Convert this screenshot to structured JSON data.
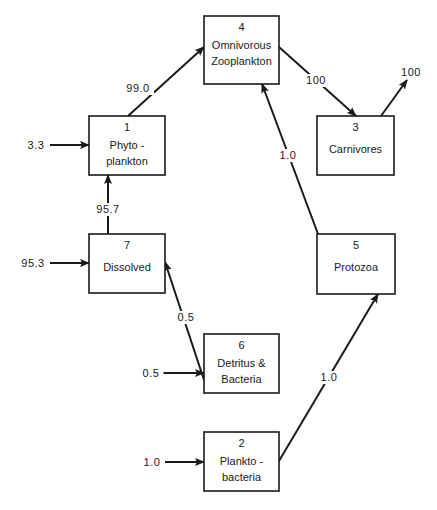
{
  "diagram": {
    "type": "compartment flow diagram",
    "nodes": [
      {
        "id": "4",
        "number": "4",
        "lines": [
          "Omnivorous",
          "Zooplankton"
        ],
        "x": 204,
        "y": 16,
        "w": 75,
        "h": 68
      },
      {
        "id": "1",
        "number": "1",
        "lines": [
          "Phyto  -",
          "plankton"
        ],
        "x": 89,
        "y": 116,
        "w": 76,
        "h": 59
      },
      {
        "id": "3",
        "number": "3",
        "lines": [
          "Carnivores"
        ],
        "x": 317,
        "y": 116,
        "w": 77,
        "h": 59
      },
      {
        "id": "7",
        "number": "7",
        "lines": [
          "Dissolved"
        ],
        "x": 89,
        "y": 234,
        "w": 76,
        "h": 59
      },
      {
        "id": "5",
        "number": "5",
        "lines": [
          "Protozoa"
        ],
        "x": 317,
        "y": 234,
        "w": 78,
        "h": 60
      },
      {
        "id": "6",
        "number": "6",
        "lines": [
          "Detritus  &",
          "Bacteria"
        ],
        "x": 204,
        "y": 334,
        "w": 75,
        "h": 59
      },
      {
        "id": "2",
        "number": "2",
        "lines": [
          "Plankto  -",
          "bacteria"
        ],
        "x": 204,
        "y": 432,
        "w": 75,
        "h": 59
      }
    ],
    "flows": [
      {
        "from": "1",
        "to": "4",
        "value": "99.0",
        "x1": 128,
        "y1": 116,
        "x2": 204,
        "y2": 47,
        "lx": 138,
        "ly": 92
      },
      {
        "from": "4",
        "to": "3",
        "value": "100",
        "x1": 279,
        "y1": 47,
        "x2": 356,
        "y2": 116,
        "lx": 316,
        "ly": 84
      },
      {
        "from": "3",
        "to": "out",
        "value": "100",
        "x1": 381,
        "y1": 116,
        "x2": 407,
        "y2": 80,
        "lx": 411,
        "ly": 76
      },
      {
        "from": "in",
        "to": "1",
        "value": "3.3",
        "x1": 50,
        "y1": 145,
        "x2": 89,
        "y2": 145,
        "lx": 36,
        "ly": 149
      },
      {
        "from": "7",
        "to": "1",
        "value": "95.7",
        "x1": 108,
        "y1": 234,
        "x2": 108,
        "y2": 175,
        "lx": 108,
        "ly": 213
      },
      {
        "from": "in",
        "to": "7",
        "value": "95.3",
        "x1": 50,
        "y1": 263,
        "x2": 89,
        "y2": 263,
        "lx": 33,
        "ly": 267
      },
      {
        "from": "6",
        "to": "7",
        "value": "0.5",
        "x1": 204,
        "y1": 380,
        "x2": 165,
        "y2": 262,
        "lx": 186,
        "ly": 321
      },
      {
        "from": "in",
        "to": "6",
        "value": "0.5",
        "x1": 163,
        "y1": 373,
        "x2": 204,
        "y2": 373,
        "lx": 151,
        "ly": 377
      },
      {
        "from": "5",
        "to": "4",
        "value": "1.0",
        "x1": 318,
        "y1": 234,
        "x2": 262,
        "y2": 84,
        "lx": 288,
        "ly": 159
      },
      {
        "from": "2",
        "to": "5",
        "value": "1.0",
        "x1": 279,
        "y1": 461,
        "x2": 378,
        "y2": 294,
        "lx": 329,
        "ly": 381
      },
      {
        "from": "in",
        "to": "2",
        "value": "1.0",
        "x1": 165,
        "y1": 462,
        "x2": 204,
        "y2": 462,
        "lx": 152,
        "ly": 466
      }
    ]
  }
}
